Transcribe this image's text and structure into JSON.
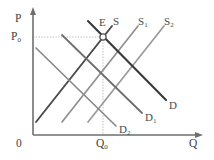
{
  "figure": {
    "type": "supply-demand-diagram",
    "background_color": "#ffffff",
    "axes": {
      "y_axis_label": "P",
      "x_axis_label": "Q",
      "origin_label": "0",
      "axis_color": "#6e6e6e"
    },
    "markers": {
      "price_level_label": "P",
      "price_level_sub": "0",
      "quantity_level_label": "Q",
      "quantity_level_sub": "0",
      "equilibrium_label": "E",
      "guide_line_color": "#b9b9b9",
      "equilibrium_marker_color": "#555555"
    },
    "curves": {
      "supply": [
        {
          "name": "S",
          "label": "S",
          "sub": "",
          "color": "#4a4a4a",
          "width": 1.9
        },
        {
          "name": "S1",
          "label": "S",
          "sub": "1",
          "color": "#8f8f8f",
          "width": 1.7
        },
        {
          "name": "S2",
          "label": "S",
          "sub": "2",
          "color": "#9a9a9a",
          "width": 1.7
        }
      ],
      "demand": [
        {
          "name": "D",
          "label": "D",
          "sub": "",
          "color": "#3a3a3a",
          "width": 2.1
        },
        {
          "name": "D1",
          "label": "D",
          "sub": "1",
          "color": "#6f6f6f",
          "width": 1.8
        },
        {
          "name": "D2",
          "label": "D",
          "sub": "2",
          "color": "#8a8a8a",
          "width": 1.7
        }
      ]
    },
    "annotations": {
      "description": "Three upward-sloping supply curves S, S1, S2 and three downward-sloping demand curves D, D1, D2 intersecting; equilibrium point E at price P0 and quantity Q0."
    }
  }
}
